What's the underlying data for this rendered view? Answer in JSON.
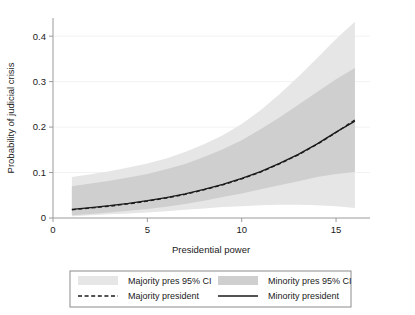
{
  "chart_data": {
    "type": "line",
    "title": "",
    "xlabel": "Presidential power",
    "ylabel": "Probability of judicial crisis",
    "xlim": [
      0,
      16.8
    ],
    "ylim": [
      0,
      0.44
    ],
    "xticks": [
      0,
      5,
      10,
      15
    ],
    "xticklabels": [
      "0",
      "5",
      "10",
      "15"
    ],
    "yticks": [
      0,
      0.1,
      0.2,
      0.3,
      0.4
    ],
    "yticklabels": [
      "0",
      "0.1",
      "0.2",
      "0.3",
      "0.4"
    ],
    "grid": "horizontal-faint",
    "legend_position": "below-plot",
    "x": [
      1,
      2,
      3,
      4,
      5,
      6,
      7,
      8,
      9,
      10,
      11,
      12,
      13,
      14,
      15,
      16
    ],
    "series": [
      {
        "name": "Majority president",
        "style": "dashed",
        "color": "#1a1a1a",
        "values": [
          0.018,
          0.022,
          0.026,
          0.031,
          0.037,
          0.044,
          0.052,
          0.062,
          0.073,
          0.086,
          0.101,
          0.119,
          0.139,
          0.162,
          0.188,
          0.216
        ]
      },
      {
        "name": "Minority president",
        "style": "solid",
        "color": "#1a1a1a",
        "values": [
          0.019,
          0.023,
          0.027,
          0.032,
          0.038,
          0.045,
          0.053,
          0.063,
          0.074,
          0.087,
          0.102,
          0.12,
          0.14,
          0.163,
          0.189,
          0.213
        ]
      }
    ],
    "bands": [
      {
        "name": "Majority pres 95% CI",
        "color": "#e6e6e6",
        "lower": [
          0.004,
          0.006,
          0.008,
          0.01,
          0.012,
          0.015,
          0.018,
          0.021,
          0.024,
          0.026,
          0.028,
          0.029,
          0.029,
          0.028,
          0.026,
          0.022
        ],
        "upper": [
          0.09,
          0.096,
          0.103,
          0.111,
          0.12,
          0.131,
          0.145,
          0.162,
          0.182,
          0.207,
          0.237,
          0.272,
          0.311,
          0.352,
          0.394,
          0.432
        ]
      },
      {
        "name": "Minority pres 95% CI",
        "color": "#cfcfcf",
        "lower": [
          0.006,
          0.009,
          0.012,
          0.016,
          0.02,
          0.025,
          0.031,
          0.038,
          0.046,
          0.054,
          0.063,
          0.072,
          0.081,
          0.09,
          0.097,
          0.101
        ],
        "upper": [
          0.07,
          0.076,
          0.082,
          0.089,
          0.097,
          0.107,
          0.119,
          0.134,
          0.151,
          0.171,
          0.195,
          0.221,
          0.249,
          0.277,
          0.305,
          0.33
        ]
      }
    ],
    "legend": [
      {
        "label": "Majority pres 95% CI",
        "type": "swatch",
        "color": "#e6e6e6"
      },
      {
        "label": "Minority pres 95% CI",
        "type": "swatch",
        "color": "#cfcfcf"
      },
      {
        "label": "Majority president",
        "type": "line-dashed",
        "color": "#1a1a1a"
      },
      {
        "label": "Minority president",
        "type": "line-solid",
        "color": "#1a1a1a"
      }
    ]
  }
}
